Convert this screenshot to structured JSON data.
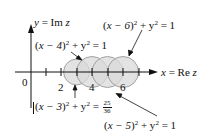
{
  "diagram": {
    "type": "complex-plane-circles",
    "axes": {
      "x_label": "x = Re z",
      "y_label": "y = Im z",
      "origin_label": "0",
      "tick_labels": [
        "2",
        "4",
        "6"
      ],
      "ticks": [
        1,
        2,
        3,
        4,
        5,
        6,
        7
      ]
    },
    "circles": [
      {
        "equation_lhs": "(x − 3)",
        "equation_rhs_num": "25",
        "equation_rhs_den": "36",
        "center": 3,
        "radius": 0.8333
      },
      {
        "equation_lhs": "(x − 4)",
        "equation_rhs": "1",
        "center": 4,
        "radius": 1
      },
      {
        "equation_lhs": "(x − 5)",
        "equation_rhs": "1",
        "center": 5,
        "radius": 1
      },
      {
        "equation_lhs": "(x − 6)",
        "equation_rhs": "1",
        "center": 6,
        "radius": 1
      }
    ],
    "labels": {
      "c3": {
        "x_part": "x − 3",
        "rest": " + y",
        "eq": " = ",
        "num": "25",
        "den": "36"
      },
      "c4": {
        "x_part": "x − 4",
        "rest": " + y",
        "eq": " = 1"
      },
      "c5": {
        "x_part": "x − 5",
        "rest": " + y",
        "eq": " = 1"
      },
      "c6": {
        "x_part": "x − 6",
        "rest": " + y",
        "eq": " = 1"
      }
    },
    "colors": {
      "circle_fill": "#d9d9d9",
      "circle_stroke": "#9a9a9a",
      "axis": "#111111"
    }
  }
}
